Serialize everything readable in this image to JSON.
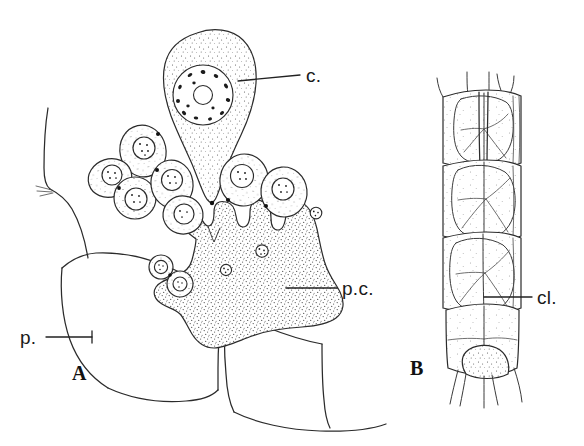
{
  "figure": {
    "type": "scientific-line-drawing",
    "background_color": "#ffffff",
    "ink_color": "#2b2b2b",
    "panels": [
      {
        "id": "A",
        "letter": "A",
        "description": "Large pear-shaped cell with nucleus, cluster of smaller rounded cells, and a large lobed plasmodial mass attached to host plate tissue",
        "labels": [
          {
            "key": "c",
            "text": "c.",
            "meaning": "large cell"
          },
          {
            "key": "pc",
            "text": "p.c.",
            "meaning": "plasmodial cell"
          },
          {
            "key": "p",
            "text": "p.",
            "meaning": "plate"
          }
        ]
      },
      {
        "id": "B",
        "letter": "B",
        "description": "Segmented tubular structure of stacked cells",
        "labels": [
          {
            "key": "cl",
            "text": "cl.",
            "meaning": "cell"
          }
        ]
      }
    ]
  },
  "labels": {
    "c": "c.",
    "pc": "p.c.",
    "p": "p.",
    "cl": "cl.",
    "panel_a": "A",
    "panel_b": "B"
  }
}
